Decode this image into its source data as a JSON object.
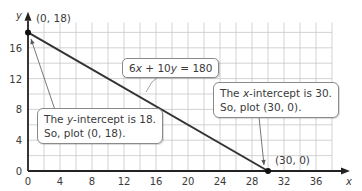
{
  "chart_data": {
    "type": "line",
    "title": "",
    "xlabel": "x",
    "ylabel": "y",
    "xlim": [
      0,
      38
    ],
    "ylim": [
      0,
      19
    ],
    "x_ticks": [
      0,
      4,
      8,
      12,
      16,
      20,
      24,
      28,
      32,
      36
    ],
    "y_ticks": [
      0,
      4,
      8,
      12,
      16
    ],
    "grid": true,
    "grid_step": 2,
    "series": [
      {
        "name": "6x + 10y = 180",
        "points": [
          [
            0,
            18
          ],
          [
            30,
            0
          ]
        ]
      }
    ],
    "points": [
      {
        "label": "(0, 18)",
        "x": 0,
        "y": 18
      },
      {
        "label": "(30, 0)",
        "x": 30,
        "y": 0
      }
    ],
    "annotations": [
      {
        "id": "equation",
        "text": "6x + 10y = 180"
      },
      {
        "id": "y_intercept",
        "lines": [
          "The y-intercept is 18.",
          "So, plot (0, 18)."
        ]
      },
      {
        "id": "x_intercept",
        "lines": [
          "The x-intercept is 30.",
          "So, plot (30, 0)."
        ]
      }
    ]
  },
  "labels": {
    "equation_pre": "6",
    "equation_x": "x",
    "equation_mid": " + 10",
    "equation_y": "y",
    "equation_post": " = 180",
    "point_y_int": "(0, 18)",
    "point_x_int": "(30, 0)",
    "y_callout_line1_pre": "The ",
    "y_callout_var": "y",
    "y_callout_line1_post": "-intercept is 18.",
    "y_callout_line2": "So, plot (0, 18).",
    "x_callout_line1_pre": "The ",
    "x_callout_var": "x",
    "x_callout_line1_post": "-intercept is 30.",
    "x_callout_line2": "So, plot (30, 0).",
    "axis_x": "x",
    "axis_y": "y"
  },
  "colors": {
    "grid": "#c8c8c8",
    "axis": "#222222",
    "line": "#333333",
    "text": "#3a3a3a"
  }
}
